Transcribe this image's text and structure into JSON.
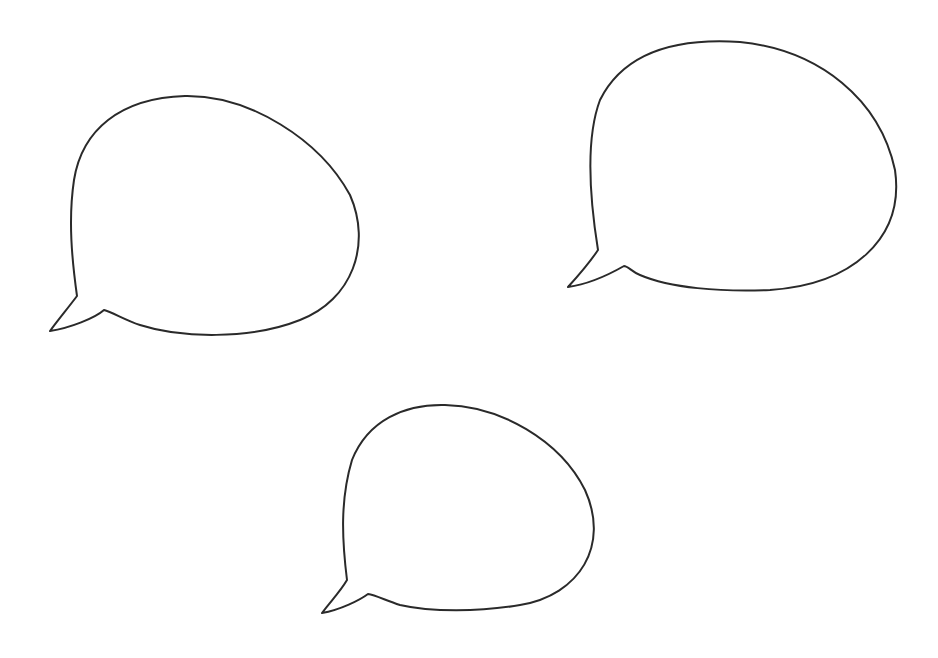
{
  "canvas": {
    "width": 938,
    "height": 658,
    "background": "#ffffff"
  },
  "stroke_color": "#2a2a2a",
  "bubbles": [
    {
      "id": "top-left",
      "text": ""
    },
    {
      "id": "top-right",
      "text": ""
    },
    {
      "id": "bottom-center",
      "text": ""
    }
  ]
}
